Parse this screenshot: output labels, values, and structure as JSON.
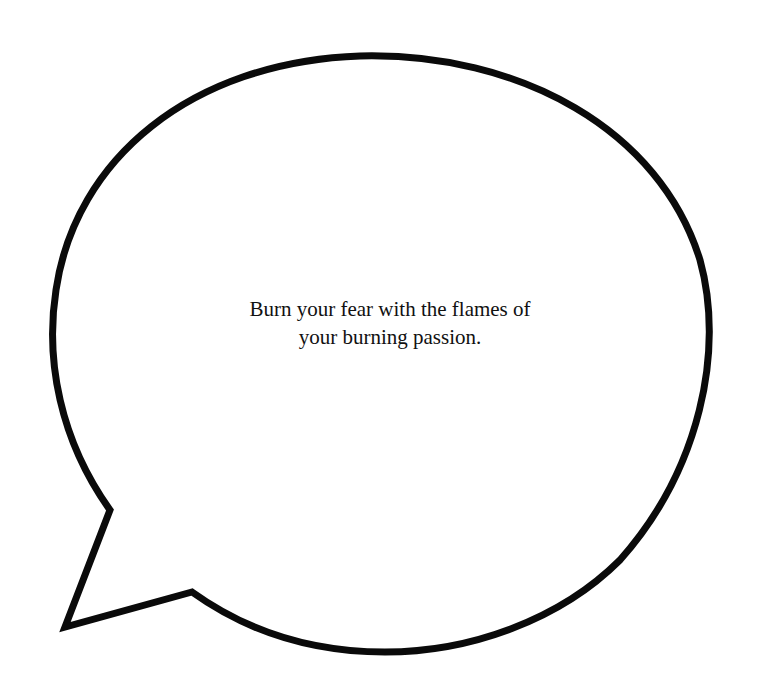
{
  "speech_bubble": {
    "text_lines": [
      "Burn your fear with the flames of",
      "your burning passion."
    ],
    "outline_color": "#0a0a0a",
    "fill_color": "#ffffff",
    "background_color": "#ffffff",
    "tail_direction": "bottom-left"
  }
}
